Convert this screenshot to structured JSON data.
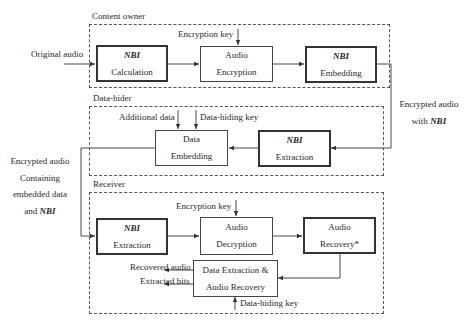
{
  "groups": {
    "content_owner": {
      "title": "Content owner",
      "input_label": "Original audio",
      "key_label": "Encryption key",
      "boxes": {
        "nbi_calculation": {
          "line1": "NBI",
          "line2": "Calculation"
        },
        "audio_encryption": {
          "line1": "Audio",
          "line2": "Encryption"
        },
        "nbi_embedding": {
          "line1": "NBI",
          "line2": "Embedding"
        }
      }
    },
    "data_hider": {
      "title": "Data-hider",
      "additional_data_label": "Additional data",
      "key_label": "Data-hiding key",
      "boxes": {
        "data_embedding": {
          "line1": "Data",
          "line2": "Embedding"
        },
        "nbi_extraction": {
          "line1": "NBI",
          "line2": "Extraction"
        }
      }
    },
    "receiver": {
      "title": "Receiver",
      "key_label": "Encryption key",
      "data_hiding_key_label": "Data-hiding key",
      "recovered_audio_label": "Recovered audio",
      "extracted_bits_label": "Extracted bits",
      "boxes": {
        "nbi_extraction": {
          "line1": "NBI",
          "line2": "Extraction"
        },
        "audio_decryption": {
          "line1": "Audio",
          "line2": "Decryption"
        },
        "audio_recovery": {
          "line1": "Audio",
          "line2": "Recovery*"
        },
        "data_extraction_recovery": {
          "line1": "Data Extraction &",
          "line2": "Audio Recovery"
        }
      }
    }
  },
  "connectors": {
    "owner_to_hider": {
      "line1": "Encrypted audio",
      "line2_prefix": "with ",
      "line2_nbi": "NBI"
    },
    "hider_to_receiver": {
      "line1": "Encrypted audio",
      "line2": "Containing",
      "line3": "embedded data",
      "line4_prefix": "and ",
      "line4_nbi": "NBI"
    }
  }
}
